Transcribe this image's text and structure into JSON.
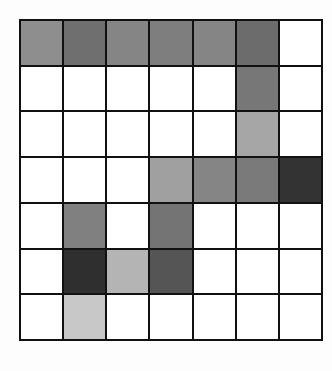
{
  "grid": {
    "rows": 7,
    "cols": 7,
    "cells": [
      [
        "#8e8e8e",
        "#6f6f6f",
        "#858585",
        "#7e7e7e",
        "#858585",
        "#6c6c6c",
        "#ffffff"
      ],
      [
        "#ffffff",
        "#ffffff",
        "#ffffff",
        "#ffffff",
        "#ffffff",
        "#777777",
        "#ffffff"
      ],
      [
        "#ffffff",
        "#ffffff",
        "#ffffff",
        "#ffffff",
        "#ffffff",
        "#a6a6a6",
        "#ffffff"
      ],
      [
        "#ffffff",
        "#ffffff",
        "#ffffff",
        "#a0a0a0",
        "#858585",
        "#7a7a7a",
        "#333333"
      ],
      [
        "#ffffff",
        "#808080",
        "#ffffff",
        "#747474",
        "#ffffff",
        "#ffffff",
        "#ffffff"
      ],
      [
        "#ffffff",
        "#2f2f2f",
        "#b4b4b4",
        "#555555",
        "#ffffff",
        "#ffffff",
        "#ffffff"
      ],
      [
        "#ffffff",
        "#c8c8c8",
        "#ffffff",
        "#ffffff",
        "#ffffff",
        "#ffffff",
        "#ffffff"
      ]
    ]
  }
}
